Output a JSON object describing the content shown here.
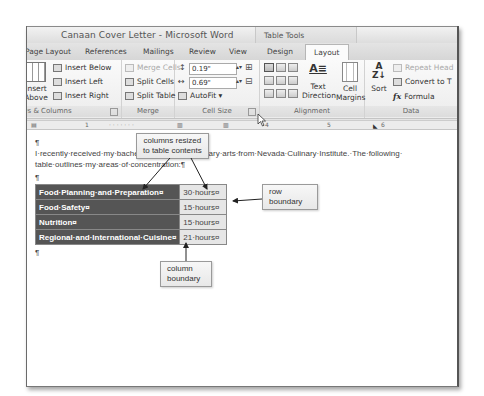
{
  "window": {
    "title": "Canaan Cover Letter - Microsoft Word",
    "context_tab_group": "Table Tools"
  },
  "tabs": [
    {
      "label": "Page Layout",
      "active": false
    },
    {
      "label": "References",
      "active": false
    },
    {
      "label": "Mailings",
      "active": false
    },
    {
      "label": "Review",
      "active": false
    },
    {
      "label": "View",
      "active": false
    },
    {
      "label": "Design",
      "active": false
    },
    {
      "label": "Layout",
      "active": true
    }
  ],
  "ribbon": {
    "rows_columns": {
      "label": "Rows & Columns",
      "insert_above": "Insert Above",
      "insert_above_l1": "Insert",
      "insert_above_l2": "Above",
      "insert_below": "Insert Below",
      "insert_left": "Insert Left",
      "insert_right": "Insert Right"
    },
    "merge": {
      "label": "Merge",
      "merge_cells": "Merge Cells",
      "split_cells": "Split Cells",
      "split_table": "Split Table"
    },
    "cell_size": {
      "label": "Cell Size",
      "height_value": "0.19\"",
      "width_value": "0.69\"",
      "autofit": "AutoFit ▾"
    },
    "alignment": {
      "label": "Alignment",
      "text_direction_l1": "Text",
      "text_direction_l2": "Direction",
      "cell_margins_l1": "Cell",
      "cell_margins_l2": "Margins"
    },
    "data": {
      "label": "Data",
      "sort": "Sort",
      "repeat_header": "Repeat Head",
      "convert_to_text": "Convert to T",
      "formula": "Formula"
    }
  },
  "ruler": {
    "marks": [
      "1",
      "4",
      "5",
      "6"
    ]
  },
  "document": {
    "pilcrow": "¶",
    "line1": "I·recently·received·my·bachelor's·degree·in·culinary·arts·from·Nevada·Culinary·Institute.·The·following·",
    "line2": "table·outlines·my·areas·of·concentration:¶",
    "table": {
      "rows": [
        {
          "area": "Food·Planning·and·Preparation¤",
          "hours": "30·hours¤"
        },
        {
          "area": "Food·Safety¤",
          "hours": "15·hours¤"
        },
        {
          "area": "Nutrition¤",
          "hours": "15·hours¤"
        },
        {
          "area": "Regional·and·International·Cuisine¤",
          "hours": "21·hours¤"
        }
      ],
      "row_end_marker": "¤"
    }
  },
  "callouts": {
    "columns_resized": {
      "l1": "columns resized",
      "l2": "to table contents"
    },
    "row_boundary": {
      "l1": "row",
      "l2": "boundary"
    },
    "column_boundary": {
      "l1": "column",
      "l2": "boundary"
    }
  }
}
